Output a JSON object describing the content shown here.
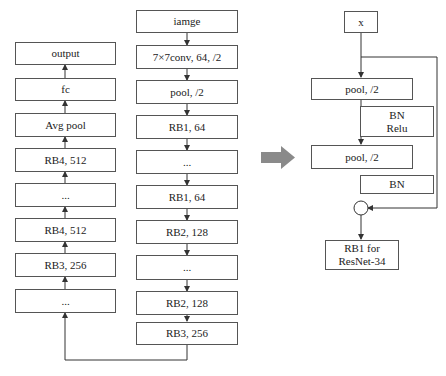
{
  "left_column": {
    "boxes": [
      "output",
      "fc",
      "Avg pool",
      "RB4, 512",
      "...",
      "RB4, 512",
      "RB3, 256",
      "..."
    ]
  },
  "middle_column": {
    "boxes": [
      "iamge",
      "7×7conv, 64, /2",
      "pool, /2",
      "RB1, 64",
      "...",
      "RB1, 64",
      "RB2, 128",
      "...",
      "RB2, 128",
      "RB3, 256"
    ]
  },
  "right_block": {
    "input": "x",
    "pool1": "pool, /2",
    "bn_relu_line1": "BN",
    "bn_relu_line2": "Relu",
    "pool2": "pool, /2",
    "bn": "BN",
    "output_line1": "RB1 for",
    "output_line2": "ResNet-34"
  },
  "colors": {
    "line": "#333333",
    "border": "#555555",
    "big_arrow": "#8a8a8a"
  }
}
